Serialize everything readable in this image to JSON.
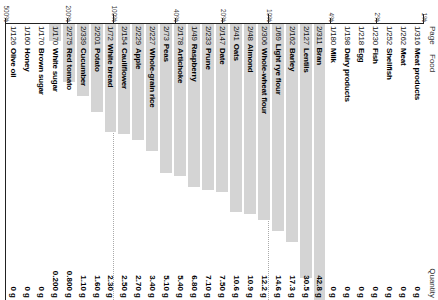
{
  "header": {
    "col_page": "Page",
    "col_food": "Food",
    "col_quantity": "Quantity"
  },
  "chart_data": {
    "type": "bar",
    "title": "",
    "xlabel": "",
    "ylabel": "",
    "scale": "log",
    "grid": true,
    "legend": false,
    "axis_ticks": [
      "1%",
      "2%",
      "4%",
      "10%",
      "20%",
      "40%",
      "100%",
      "200%",
      "500%"
    ],
    "axis_tick_values": [
      1,
      2,
      4,
      10,
      20,
      40,
      100,
      200,
      500
    ],
    "gridlines_at": [
      "10%",
      "100%"
    ],
    "categories": [
      "Meat products",
      "Meat",
      "Shellfish",
      "Fish",
      "Egg",
      "Dairy products",
      "Milk",
      "Bran",
      "Lentils",
      "Barley",
      "Light rye flour",
      "Whole-wheat flour",
      "Almond",
      "Oats",
      "Date",
      "Prune",
      "Raspberry",
      "Artichoke",
      "Peas",
      "Whole-grain rice",
      "Apple",
      "Cauliflower",
      "White bread",
      "Potato",
      "Cucumber",
      "Red tomato",
      "White sugar",
      "Brown sugar",
      "Honey",
      "Olive oil"
    ],
    "values": [
      0,
      0,
      0,
      0,
      0,
      0,
      42.8,
      30.5,
      17.3,
      14.6,
      12.2,
      10.9,
      10.6,
      7.5,
      7.1,
      6.8,
      5.4,
      5.1,
      3.4,
      2.7,
      2.5,
      2.3,
      1.6,
      1.1,
      0.8,
      0.2,
      0,
      0,
      0,
      0
    ],
    "value_labels": [
      "0 g",
      "0 g",
      "0 g",
      "0 g",
      "0 g",
      "0 g",
      "42.8 g",
      "30.5 g",
      "17.3 g",
      "14.6 g",
      "12.2 g",
      "10.9 g",
      "10.6 g",
      "7.50 g",
      "7.10 g",
      "6.80 g",
      "5.40 g",
      "5.10 g",
      "3.40 g",
      "2.70 g",
      "2.50 g",
      "2.30 g",
      "1.60 g",
      "1.10 g",
      "0.800 g",
      "0.200 g",
      "0 g",
      "0 g",
      "0 g",
      "0 g"
    ],
    "unit": "g"
  },
  "rows": [
    {
      "page": "1/316",
      "food": "Meat products",
      "quantity": "0 g",
      "bar": 0
    },
    {
      "page": "1/262",
      "food": "Meat",
      "quantity": "0 g",
      "bar": 0
    },
    {
      "page": "1/252",
      "food": "Shellfish",
      "quantity": "0 g",
      "bar": 0
    },
    {
      "page": "1/230",
      "food": "Fish",
      "quantity": "0 g",
      "bar": 0
    },
    {
      "page": "1/218",
      "food": "Egg",
      "quantity": "0 g",
      "bar": 0
    },
    {
      "page": "1/198",
      "food": "Dairy products",
      "quantity": "0 g",
      "bar": 0
    },
    {
      "page": "1/180",
      "food": "Milk",
      "quantity": "0 g",
      "bar": 0
    },
    {
      "page": "2/311",
      "food": "Bran",
      "quantity": "42.8 g",
      "bar": 100
    },
    {
      "page": "2/127",
      "food": "Lentils",
      "quantity": "30.5 g",
      "bar": 92
    },
    {
      "page": "2/162",
      "food": "Barley",
      "quantity": "17.3 g",
      "bar": 79
    },
    {
      "page": "1/69",
      "food": "Light rye flour",
      "quantity": "14.6 g",
      "bar": 75
    },
    {
      "page": "2/306",
      "food": "Whole-wheat flour",
      "quantity": "12.2 g",
      "bar": 71
    },
    {
      "page": "2/48",
      "food": "Almond",
      "quantity": "10.9 g",
      "bar": 69
    },
    {
      "page": "2/41",
      "food": "Oats",
      "quantity": "10.6 g",
      "bar": 68
    },
    {
      "page": "2/147",
      "food": "Date",
      "quantity": "7.50 g",
      "bar": 61
    },
    {
      "page": "2/233",
      "food": "Prune",
      "quantity": "7.10 g",
      "bar": 60
    },
    {
      "page": "1/49",
      "food": "Raspberry",
      "quantity": "6.80 g",
      "bar": 59
    },
    {
      "page": "2/178",
      "food": "Artichoke",
      "quantity": "5.40 g",
      "bar": 55
    },
    {
      "page": "2/73",
      "food": "Peas",
      "quantity": "5.10 g",
      "bar": 54
    },
    {
      "page": "2/227",
      "food": "Whole-grain rice",
      "quantity": "3.40 g",
      "bar": 46
    },
    {
      "page": "2/229",
      "food": "Apple",
      "quantity": "2.70 g",
      "bar": 42
    },
    {
      "page": "2/154",
      "food": "Cauliflower",
      "quantity": "2.50 g",
      "bar": 40
    },
    {
      "page": "1/72",
      "food": "White bread",
      "quantity": "2.30 g",
      "bar": 39
    },
    {
      "page": "2/201",
      "food": "Potato",
      "quantity": "1.60 g",
      "bar": 32
    },
    {
      "page": "2/339",
      "food": "Cucumber",
      "quantity": "1.10 g",
      "bar": 26
    },
    {
      "page": "2/275",
      "food": "Red tomato",
      "quantity": "0.800 g",
      "bar": 21
    },
    {
      "page": "1/170",
      "food": "White sugar",
      "quantity": "0.200 g",
      "bar": 6
    },
    {
      "page": "1/170",
      "food": "Brown sugar",
      "quantity": "0 g",
      "bar": 0
    },
    {
      "page": "1/160",
      "food": "Honey",
      "quantity": "0 g",
      "bar": 0
    },
    {
      "page": "1/126",
      "food": "Olive oil",
      "quantity": "0 g",
      "bar": 0
    }
  ]
}
